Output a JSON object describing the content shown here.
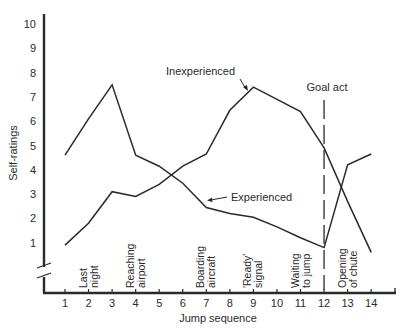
{
  "chart_data": {
    "type": "line",
    "title": "",
    "xlabel": "Jump sequence",
    "ylabel": "Self-ratings",
    "x": [
      1,
      2,
      3,
      4,
      5,
      6,
      7,
      8,
      9,
      10,
      11,
      12,
      13,
      14
    ],
    "xticks": [
      "1",
      "2",
      "3",
      "4",
      "5",
      "6",
      "7",
      "8",
      "9",
      "10",
      "11",
      "12",
      "13",
      "14"
    ],
    "yticks": [
      "1",
      "2",
      "3",
      "4",
      "5",
      "6",
      "7",
      "8",
      "9",
      "10"
    ],
    "ylim": [
      0,
      10
    ],
    "xlim": [
      0,
      15
    ],
    "grid": false,
    "legend": "inline annotations",
    "series": [
      {
        "name": "Inexperienced",
        "values": [
          0.9,
          1.8,
          3.1,
          2.9,
          3.4,
          4.15,
          4.65,
          6.45,
          7.4,
          6.9,
          6.4,
          4.9,
          2.7,
          0.6
        ]
      },
      {
        "name": "Experienced",
        "values": [
          4.6,
          6.1,
          7.5,
          4.6,
          4.15,
          3.45,
          2.45,
          2.2,
          2.05,
          1.65,
          1.2,
          0.8,
          4.2,
          4.65
        ]
      }
    ],
    "event_labels": [
      {
        "x": 2,
        "lines": [
          "Last",
          "night"
        ]
      },
      {
        "x": 4,
        "lines": [
          "Reaching",
          "airport"
        ]
      },
      {
        "x": 7,
        "lines": [
          "Boarding",
          "aircraft"
        ]
      },
      {
        "x": 9,
        "lines": [
          "'Ready'",
          "signal"
        ]
      },
      {
        "x": 11,
        "lines": [
          "Waiting",
          "to jump"
        ]
      },
      {
        "x": 13,
        "lines": [
          "Opening",
          "of chute"
        ]
      }
    ],
    "annotations": [
      {
        "text": "Inexperienced",
        "target_series": "Inexperienced"
      },
      {
        "text": "Experienced",
        "target_series": "Experienced"
      },
      {
        "text": "Goal act",
        "x": 12,
        "style": "dashed vertical line"
      }
    ]
  }
}
